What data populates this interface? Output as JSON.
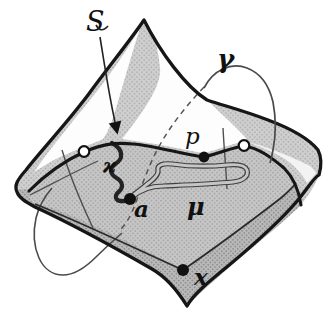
{
  "figure": {
    "type": "hand-drawn topology diagram",
    "labels": {
      "surface": "S",
      "gamma": "γ",
      "point_p": "p",
      "kappa": "ϰ",
      "point_a": "a",
      "mu": "μ",
      "point_x": "x"
    },
    "markers": {
      "filled_points": [
        "p",
        "a",
        "x"
      ],
      "open_points_count": 2
    },
    "colors": {
      "background": "#ffffff",
      "ink": "#161616",
      "thin_line": "#4a4a4a",
      "flap_halftone_base": "#cfcfcf",
      "face_halftone_base": "#b9b9b9",
      "inner_halftone_base": "#c6c6c6",
      "halftone_dot": "#8a8a8a"
    }
  }
}
